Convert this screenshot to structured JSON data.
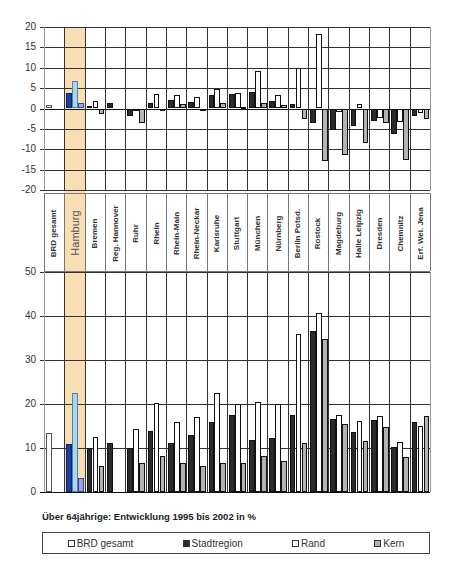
{
  "caption": "Über 64jährige: Entwicklung 1995 bis 2002 in %",
  "legend": [
    {
      "label": "BRD gesamt",
      "color": "#ffffff",
      "key": "brd"
    },
    {
      "label": "Stadtregion",
      "color": "#2b2b2b",
      "key": "stadt"
    },
    {
      "label": "Rand",
      "color": "#ffffff",
      "key": "rand"
    },
    {
      "label": "Kern",
      "color": "#b3b3b3",
      "key": "kern"
    }
  ],
  "highlight_category": "Hamburg",
  "highlight_colors": {
    "band": "#f8dfb3",
    "stadt": "#1a3fa0",
    "rand": "#a6d8f5",
    "kern": "#9aa4e0"
  },
  "chart_data": [
    {
      "type": "bar",
      "title": "",
      "xlabel": "",
      "ylabel": "",
      "ylim": [
        -20,
        20
      ],
      "yticks": [
        20,
        15,
        10,
        5,
        0,
        -5,
        -10,
        -15,
        -20
      ],
      "grid": true,
      "categories": [
        "BRD gesamt",
        "Hamburg",
        "Bremen",
        "Reg. Hannover",
        "Ruhr",
        "Rhein",
        "Rhein-Main",
        "Rhein-Neckar",
        "Karlsruhe",
        "Stuttgart",
        "München",
        "Nürnberg",
        "Berlin Potsd.",
        "Rostock",
        "Magdeburg",
        "Halle Leipzig",
        "Dresden",
        "Chemnitz",
        "Erf. Wei. Jena"
      ],
      "series": [
        {
          "name": "BRD gesamt",
          "values": [
            0.8,
            null,
            null,
            null,
            null,
            null,
            null,
            null,
            null,
            null,
            null,
            null,
            null,
            null,
            null,
            null,
            null,
            null,
            null
          ]
        },
        {
          "name": "Stadtregion",
          "values": [
            null,
            3.7,
            0.6,
            1.4,
            -1.9,
            1.3,
            2.2,
            1.5,
            3.4,
            3.6,
            4.0,
            1.9,
            1.0,
            -3.5,
            -5.3,
            -4.2,
            -3.1,
            -6.3,
            -1.8
          ]
        },
        {
          "name": "Rand",
          "values": [
            null,
            6.7,
            1.9,
            null,
            -0.3,
            3.5,
            3.3,
            2.7,
            4.8,
            3.9,
            9.2,
            3.4,
            9.9,
            18.2,
            -0.9,
            1.2,
            -2.3,
            -3.2,
            -1.1
          ]
        },
        {
          "name": "Kern",
          "values": [
            null,
            1.3,
            -1.3,
            null,
            -3.5,
            -0.6,
            1.0,
            -0.6,
            1.4,
            0.4,
            1.3,
            0.8,
            -2.5,
            -13.0,
            -11.4,
            -8.4,
            -3.6,
            -12.7,
            -2.6
          ]
        }
      ],
      "legend_position": "bottom"
    },
    {
      "type": "bar",
      "title": "Über 64jährige: Entwicklung 1995 bis 2002 in %",
      "xlabel": "",
      "ylabel": "",
      "ylim": [
        0,
        50
      ],
      "yticks": [
        50,
        40,
        30,
        20,
        10,
        0
      ],
      "grid": true,
      "categories": [
        "BRD gesamt",
        "Hamburg",
        "Bremen",
        "Reg. Hannover",
        "Ruhr",
        "Rhein",
        "Rhein-Main",
        "Rhein-Neckar",
        "Karlsruhe",
        "Stuttgart",
        "München",
        "Nürnberg",
        "Berlin Potsd.",
        "Rostock",
        "Magdeburg",
        "Halle Leipzig",
        "Dresden",
        "Chemnitz",
        "Erf. Wei. Jena"
      ],
      "series": [
        {
          "name": "BRD gesamt",
          "values": [
            13.4,
            null,
            null,
            null,
            null,
            null,
            null,
            null,
            null,
            null,
            null,
            null,
            null,
            null,
            null,
            null,
            null,
            null,
            null
          ]
        },
        {
          "name": "Stadtregion",
          "values": [
            null,
            10.8,
            10.0,
            11.2,
            10.0,
            13.8,
            11.2,
            13.0,
            15.9,
            17.4,
            11.8,
            12.3,
            17.6,
            36.6,
            16.6,
            13.6,
            16.4,
            10.3,
            15.8
          ]
        },
        {
          "name": "Rand",
          "values": [
            null,
            22.6,
            12.6,
            null,
            14.4,
            20.3,
            15.9,
            17.1,
            22.4,
            19.9,
            20.5,
            19.9,
            36.0,
            40.6,
            17.6,
            16.1,
            17.3,
            11.3,
            15.0
          ]
        },
        {
          "name": "Kern",
          "values": [
            null,
            3.1,
            6.0,
            null,
            6.5,
            8.1,
            6.5,
            6.0,
            6.7,
            6.6,
            8.1,
            7.1,
            11.2,
            34.7,
            15.4,
            11.5,
            14.7,
            8.0,
            17.3
          ]
        }
      ],
      "legend_position": "bottom"
    }
  ]
}
